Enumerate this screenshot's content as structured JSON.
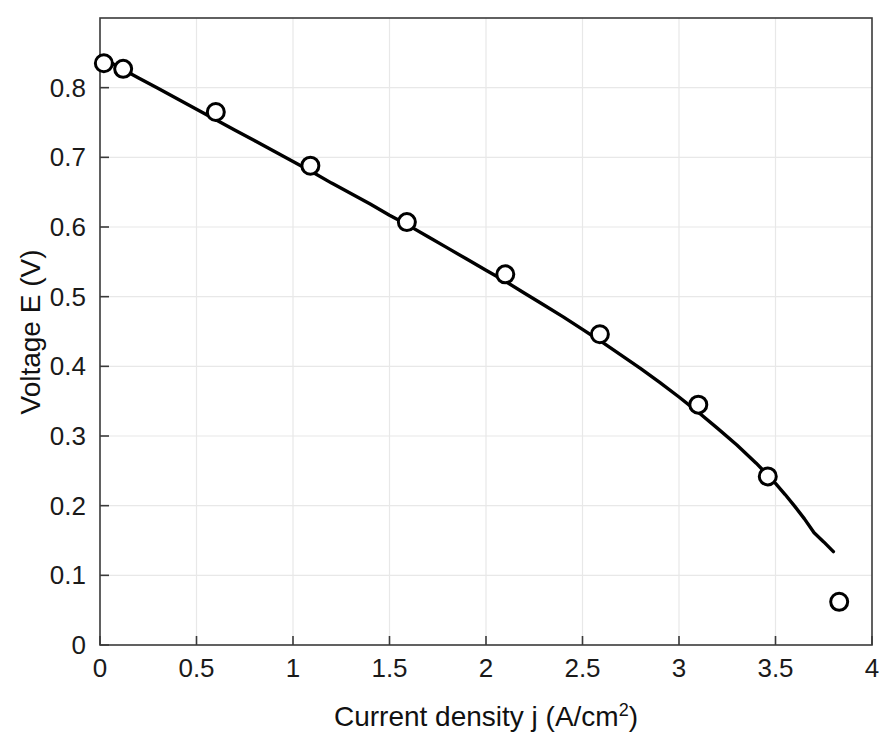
{
  "chart_data": {
    "type": "scatter",
    "title": "",
    "xlabel": "Current density j (A/cm2)",
    "xlabel_base": "Current density j (A/cm",
    "xlabel_sup": "2",
    "xlabel_tail": ")",
    "ylabel": "Voltage E (V)",
    "xlim": [
      0,
      4
    ],
    "ylim": [
      0,
      0.9
    ],
    "xticks": [
      0,
      0.5,
      1,
      1.5,
      2,
      2.5,
      3,
      3.5,
      4
    ],
    "xticklabels": [
      "0",
      "0.5",
      "1",
      "1.5",
      "2",
      "2.5",
      "3",
      "3.5",
      "4"
    ],
    "yticks": [
      0,
      0.1,
      0.2,
      0.3,
      0.4,
      0.5,
      0.6,
      0.7,
      0.8
    ],
    "yticklabels": [
      "0",
      "0.1",
      "0.2",
      "0.3",
      "0.4",
      "0.5",
      "0.6",
      "0.7",
      "0.8"
    ],
    "grid": true,
    "legend": "none",
    "series": [
      {
        "name": "Measured data",
        "style": "open-circle-markers",
        "marker_color": "#000000",
        "x": [
          0.02,
          0.12,
          0.6,
          1.09,
          1.59,
          2.1,
          2.59,
          3.1,
          3.46,
          3.83
        ],
        "y": [
          0.835,
          0.827,
          0.765,
          0.688,
          0.607,
          0.532,
          0.446,
          0.345,
          0.242,
          0.062
        ]
      },
      {
        "name": "Model fit",
        "style": "solid-line",
        "line_color": "#000000",
        "x": [
          0.0,
          0.1,
          0.2,
          0.3,
          0.4,
          0.5,
          0.6,
          0.7,
          0.8,
          0.9,
          1.0,
          1.1,
          1.2,
          1.3,
          1.4,
          1.5,
          1.6,
          1.7,
          1.8,
          1.9,
          2.0,
          2.1,
          2.2,
          2.3,
          2.4,
          2.5,
          2.6,
          2.7,
          2.8,
          2.9,
          3.0,
          3.1,
          3.2,
          3.3,
          3.4,
          3.5,
          3.55,
          3.6,
          3.65,
          3.7,
          3.75,
          3.8
        ],
        "y": [
          0.845,
          0.829,
          0.814,
          0.799,
          0.784,
          0.769,
          0.754,
          0.739,
          0.724,
          0.709,
          0.694,
          0.679,
          0.663,
          0.648,
          0.633,
          0.617,
          0.602,
          0.586,
          0.57,
          0.554,
          0.538,
          0.522,
          0.505,
          0.488,
          0.471,
          0.453,
          0.435,
          0.416,
          0.397,
          0.377,
          0.356,
          0.334,
          0.311,
          0.287,
          0.261,
          0.232,
          0.216,
          0.199,
          0.181,
          0.161,
          0.148,
          0.134
        ]
      }
    ],
    "colors": {
      "axis": "#3a3a3a",
      "grid": "#e8e8e8",
      "data": "#000000",
      "background": "#ffffff"
    }
  }
}
